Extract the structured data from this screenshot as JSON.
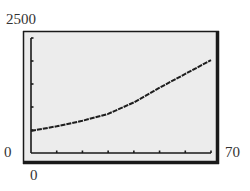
{
  "window": {
    "ymax_label": "2500",
    "ymin_label": "0",
    "xmin_label": "0",
    "xmax_label": "70"
  },
  "colors": {
    "screen_bg": "#ececec",
    "frame": "#1a1a1a",
    "curve": "#1e1e1e"
  },
  "chart_data": {
    "type": "line",
    "title": "",
    "xlabel": "",
    "ylabel": "",
    "xlim": [
      0,
      70
    ],
    "ylim": [
      0,
      2500
    ],
    "xticks_step": 10,
    "yticks_step": 500,
    "grid": false,
    "legend": null,
    "series": [
      {
        "name": "curve",
        "x": [
          0,
          10,
          20,
          30,
          40,
          50,
          60,
          70
        ],
        "y": [
          480,
          580,
          700,
          850,
          1100,
          1420,
          1720,
          2020
        ]
      }
    ]
  }
}
